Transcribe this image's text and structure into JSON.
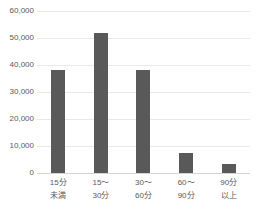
{
  "chart_data": {
    "type": "bar",
    "title": "",
    "subtitle": "",
    "xlabel": "",
    "ylabel": "",
    "categories": [
      "15分\n未満",
      "15〜\n30分",
      "30〜\n60分",
      "60〜\n90分",
      "90分\n以上"
    ],
    "category_lines": [
      [
        "15分",
        "未満"
      ],
      [
        "15〜",
        "30分"
      ],
      [
        "30〜",
        "60分"
      ],
      [
        "60〜",
        "90分"
      ],
      [
        "90分",
        "以上"
      ]
    ],
    "values": [
      38000,
      52000,
      38000,
      7500,
      3500
    ],
    "ylim": [
      0,
      60000
    ],
    "ytick_values": [
      0,
      10000,
      20000,
      30000,
      40000,
      50000,
      60000
    ],
    "ytick_labels": [
      "0",
      "10,000",
      "20,000",
      "30,000",
      "40,000",
      "50,000",
      "60,000"
    ],
    "grid": true,
    "grid_axis": "y",
    "legend": false,
    "legend_position": "none",
    "bar_color": "#595959",
    "gridline_color": "#E8E8E8",
    "axis_line_color": "#D4D4D4",
    "background_color": "#FFFFFF",
    "tick_label_color": "#595959"
  }
}
